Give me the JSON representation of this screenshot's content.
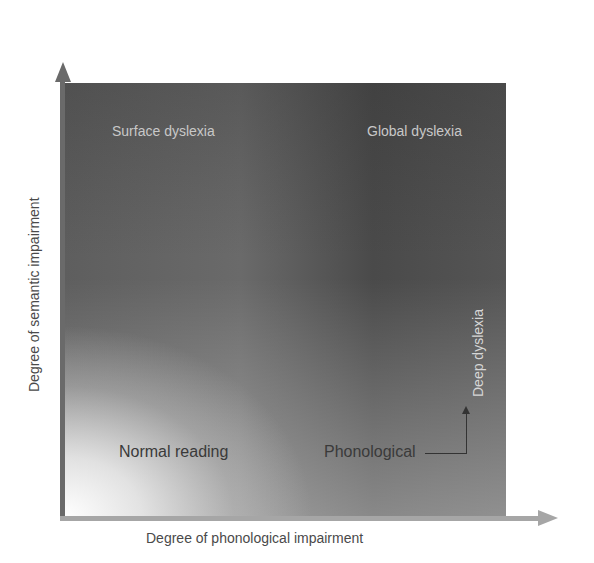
{
  "diagram": {
    "type": "quadrant-gradient",
    "x_axis": {
      "label": "Degree of phonological impairment",
      "color": "#a6a6a6"
    },
    "y_axis": {
      "label": "Degree of semantic impairment",
      "color": "#6a6a6a"
    },
    "regions": {
      "top_left": "Surface dyslexia",
      "top_right": "Global dyslexia",
      "bottom_left": "Normal reading",
      "bottom_right": "Phonological",
      "right_vertical": "Deep dyslexia"
    },
    "connector": {
      "from": "Phonological",
      "to": "Deep dyslexia"
    },
    "colors": {
      "dark_region": "#555555",
      "light_region": "#ffffff",
      "light_text": "#c8c8c8",
      "dark_text": "#3a3a3a"
    }
  }
}
